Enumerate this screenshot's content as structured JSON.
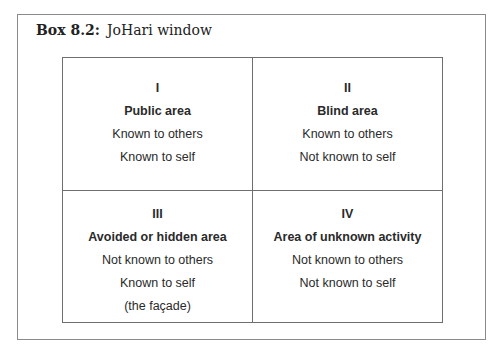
{
  "box": {
    "label": "Box 8.2:",
    "title": "JoHari window"
  },
  "quadrants": [
    {
      "numeral": "I",
      "title": "Public area",
      "lines": [
        "Known to others",
        "Known to self"
      ]
    },
    {
      "numeral": "II",
      "title": "Blind area",
      "lines": [
        "Known to others",
        "Not known to self"
      ]
    },
    {
      "numeral": "III",
      "title": "Avoided or hidden area",
      "lines": [
        "Not known to others",
        "Known to self",
        "(the façade)"
      ]
    },
    {
      "numeral": "IV",
      "title": "Area of unknown activity",
      "lines": [
        "Not known to others",
        "Not known to self"
      ]
    }
  ]
}
